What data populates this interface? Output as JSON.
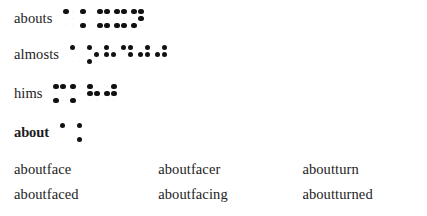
{
  "page": {
    "background_color": "#ffffff",
    "text_color": "#1c1c1c",
    "dot_color": "#111111",
    "dot_empty_color": "#f2f2f2"
  },
  "entries": [
    {
      "headword": "abouts",
      "bold": false,
      "cells": [
        [
          1,
          0,
          0,
          0,
          0,
          0
        ],
        [
          1,
          0,
          1,
          0,
          0,
          0
        ],
        [
          1,
          0,
          1,
          1,
          0,
          1
        ],
        [
          1,
          0,
          1,
          1,
          0,
          1
        ],
        [
          1,
          0,
          1,
          1,
          1,
          0
        ]
      ]
    },
    {
      "headword": "almosts",
      "bold": false,
      "cells": [
        [
          1,
          0,
          0,
          0,
          0,
          0
        ],
        [
          1,
          0,
          1,
          0,
          1,
          0
        ],
        [
          1,
          1,
          0,
          0,
          1,
          0
        ],
        [
          1,
          0,
          0,
          1,
          1,
          0
        ],
        [
          0,
          1,
          0,
          1,
          1,
          0
        ],
        [
          0,
          1,
          0,
          1,
          1,
          0
        ]
      ]
    },
    {
      "headword": "hims",
      "bold": false,
      "cells": [
        [
          1,
          0,
          1,
          1,
          0,
          0
        ],
        [
          1,
          0,
          1,
          0,
          0,
          0
        ],
        [
          1,
          1,
          0,
          0,
          1,
          0
        ],
        [
          0,
          1,
          0,
          1,
          1,
          0
        ]
      ]
    },
    {
      "headword": "about",
      "bold": true,
      "cells": [
        [
          1,
          0,
          0,
          0,
          0,
          0
        ],
        [
          1,
          0,
          1,
          0,
          0,
          0
        ]
      ]
    }
  ],
  "wordlist": {
    "columns": 3,
    "rows": [
      [
        "aboutface",
        "aboutfacer",
        "aboutturn"
      ],
      [
        "aboutfaced",
        "aboutfacing",
        "aboutturned"
      ]
    ]
  }
}
